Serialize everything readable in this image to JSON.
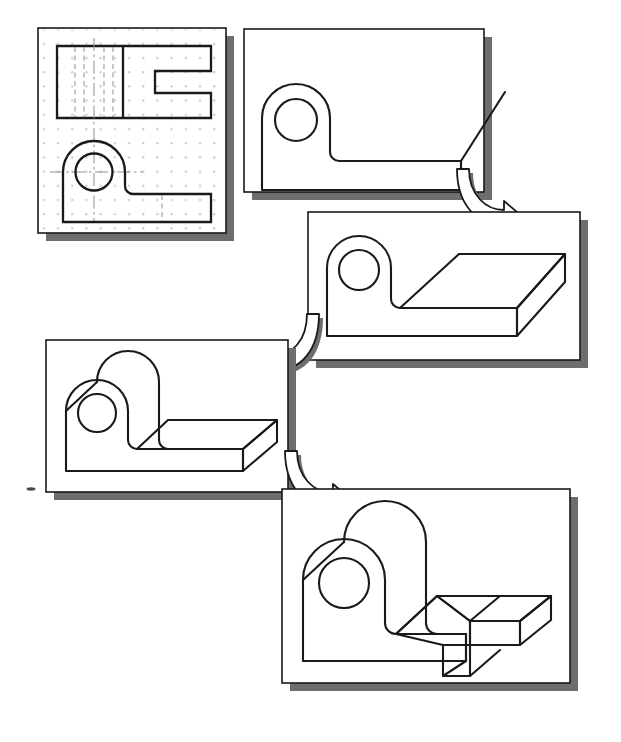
{
  "figure": {
    "title": "Solid modeling construction sequence",
    "description": "Five-step progression from a 2D orthographic multiview drawing to a finished 3D solid model of an angle bracket with a cylindrical boss and a rectangular slot.",
    "background_color": "#ffffff",
    "line_color": "#1a1a1a",
    "shadow_color": "#6e6e6e",
    "grid_dot_color": "#c8c8c8",
    "hidden_line_color": "#9a9a9a",
    "panel_count": 5,
    "arrow_count": 3
  },
  "panels": [
    {
      "id": "panel-1",
      "step": 1,
      "name": "orthographic-multiview-drawing",
      "caption": "Orthographic multiview drawing on dotted grid",
      "x": 38,
      "y": 28,
      "w": 188,
      "h": 205,
      "has_grid": true,
      "has_hidden_lines": true,
      "has_center_lines": true,
      "views": [
        "top view with rectangular notch",
        "front view with circular hole and base"
      ]
    },
    {
      "id": "panel-2",
      "step": 2,
      "name": "flat-profile-with-extrusion-guide",
      "caption": "Flat 2D profile with diagonal extrusion direction line",
      "x": 244,
      "y": 29,
      "w": 240,
      "h": 163,
      "has_grid": false,
      "has_hidden_lines": false,
      "has_center_lines": false,
      "views": [
        "profile outline",
        "extrusion guide line"
      ]
    },
    {
      "id": "panel-3",
      "step": 3,
      "name": "base-plate-extruded",
      "caption": "Base plate extruded into a 3D slab",
      "x": 308,
      "y": 212,
      "w": 272,
      "h": 148,
      "has_grid": false,
      "has_hidden_lines": false,
      "has_center_lines": false,
      "views": [
        "extruded base slab",
        "flat boss profile"
      ]
    },
    {
      "id": "panel-4",
      "step": 4,
      "name": "boss-extruded",
      "caption": "Cylindrical boss extruded to full depth",
      "x": 46,
      "y": 340,
      "w": 242,
      "h": 152,
      "has_grid": false,
      "has_hidden_lines": false,
      "has_center_lines": false,
      "views": [
        "extruded boss",
        "extruded base slab"
      ]
    },
    {
      "id": "panel-5",
      "step": 5,
      "name": "finished-solid-with-slot",
      "caption": "Finished solid model with rectangular slot cut in the base",
      "x": 282,
      "y": 489,
      "w": 288,
      "h": 194,
      "has_grid": false,
      "has_hidden_lines": false,
      "has_center_lines": false,
      "views": [
        "finished solid",
        "rectangular slot cut"
      ]
    }
  ],
  "arrows": [
    {
      "id": "arrow-1",
      "name": "step-arrow-1-to-3",
      "from_panel": "panel-2",
      "to_panel": "panel-3",
      "direction": "curve-right-then-down",
      "caption": "Proceed to step 3"
    },
    {
      "id": "arrow-2",
      "name": "step-arrow-3-to-4",
      "from_panel": "panel-3",
      "to_panel": "panel-4",
      "direction": "curve-left-then-down",
      "caption": "Proceed to step 4"
    },
    {
      "id": "arrow-3",
      "name": "step-arrow-4-to-5",
      "from_panel": "panel-4",
      "to_panel": "panel-5",
      "direction": "curve-right-then-down",
      "caption": "Proceed to step 5"
    }
  ],
  "artifacts": [
    {
      "id": "speck-1",
      "name": "scan-speck",
      "x": 27,
      "y": 488,
      "w": 8,
      "h": 3,
      "caption": "Small scan artifact near left margin"
    }
  ]
}
